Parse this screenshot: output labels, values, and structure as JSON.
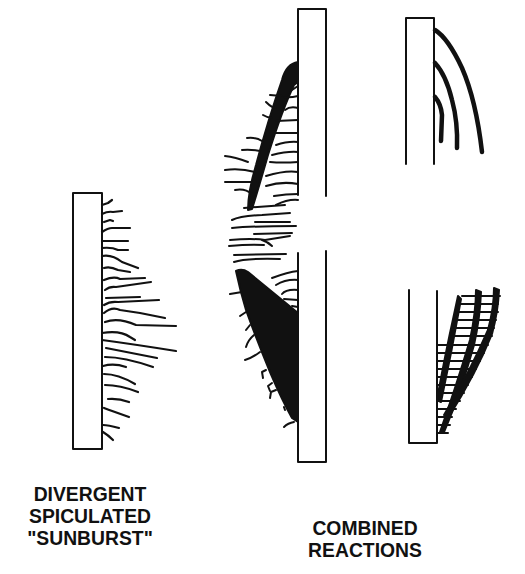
{
  "diagram": {
    "colors": {
      "ink": "#111111",
      "background": "#ffffff"
    },
    "panels": [
      {
        "id": "left",
        "caption_lines": [
          "DIVERGENT",
          "SPICULATED",
          "\"SUNBURST\""
        ]
      },
      {
        "id": "right",
        "caption_lines": [
          "COMBINED",
          "REACTIONS"
        ]
      }
    ]
  }
}
